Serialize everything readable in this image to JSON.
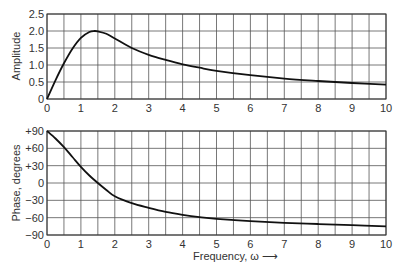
{
  "chart_data": [
    {
      "type": "line",
      "title": "",
      "xlabel": "",
      "ylabel": "Amplitude",
      "xlim": [
        0,
        10
      ],
      "ylim": [
        0,
        2.5
      ],
      "grid": true,
      "xticks": [
        "0",
        "1",
        "2",
        "3",
        "4",
        "5",
        "6",
        "7",
        "8",
        "9",
        "10"
      ],
      "yticks": [
        "0",
        "0.5",
        "1.0",
        "1.5",
        "2.0",
        "2.5"
      ],
      "x": [
        0,
        0.25,
        0.5,
        0.75,
        1.0,
        1.25,
        1.4,
        1.5,
        1.75,
        2.0,
        2.5,
        3.0,
        3.5,
        4.0,
        4.5,
        5.0,
        6.0,
        7.0,
        8.0,
        9.0,
        10.0
      ],
      "series": [
        {
          "name": "Amplitude",
          "values": [
            0,
            0.55,
            1.05,
            1.48,
            1.8,
            1.97,
            2.0,
            1.99,
            1.92,
            1.78,
            1.5,
            1.3,
            1.15,
            1.02,
            0.92,
            0.83,
            0.7,
            0.6,
            0.53,
            0.47,
            0.42
          ]
        }
      ]
    },
    {
      "type": "line",
      "title": "",
      "xlabel": "Frequency, ω ⟶",
      "ylabel": "Phase, degrees",
      "xlim": [
        0,
        10
      ],
      "ylim": [
        -90,
        90
      ],
      "grid": true,
      "xticks": [
        "0",
        "1",
        "2",
        "3",
        "4",
        "5",
        "6",
        "7",
        "8",
        "9",
        "10"
      ],
      "yticks": [
        "+90",
        "+60",
        "+30",
        "0",
        "−30",
        "−60",
        "−90"
      ],
      "x": [
        0,
        0.25,
        0.5,
        0.75,
        1.0,
        1.25,
        1.5,
        1.75,
        2.0,
        2.5,
        3.0,
        3.5,
        4.0,
        4.5,
        5.0,
        6.0,
        7.0,
        8.0,
        9.0,
        10.0
      ],
      "series": [
        {
          "name": "Phase",
          "values": [
            90,
            77,
            62,
            45,
            28,
            13,
            0,
            -12,
            -23,
            -35,
            -43,
            -50,
            -55,
            -59,
            -62,
            -66,
            -69,
            -71,
            -73,
            -75
          ]
        }
      ]
    }
  ],
  "labels": {
    "amp_ylabel": "Amplitude",
    "phase_ylabel": "Phase, degrees",
    "xlabel": "Frequency, ω ⟶"
  }
}
